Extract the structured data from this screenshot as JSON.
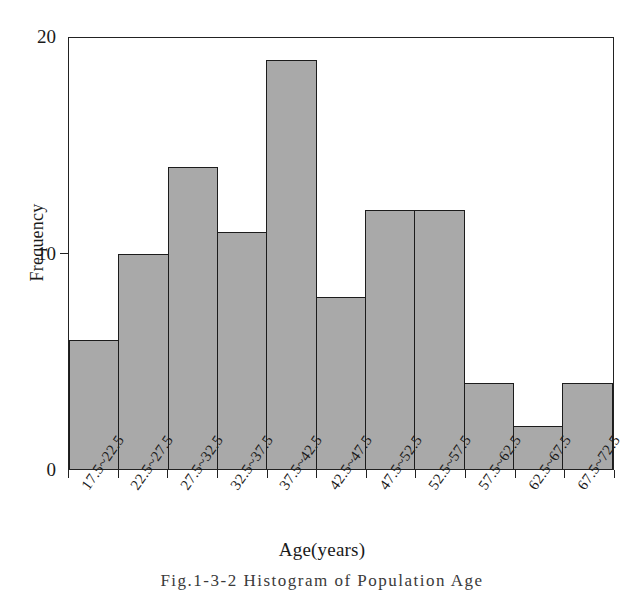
{
  "chart_data": {
    "type": "bar",
    "title": "",
    "xlabel": "Age(years)",
    "ylabel": "Frequency",
    "categories": [
      "17.5~22.5",
      "22.5~27.5",
      "27.5~32.5",
      "32.5~37.5",
      "37.5~42.5",
      "42.5~47.5",
      "47.5~52.5",
      "52.5~57.5",
      "57.5~62.5",
      "62.5~67.5",
      "67.5~72.5"
    ],
    "values": [
      6,
      10,
      14,
      11,
      19,
      8,
      12,
      12,
      4,
      2,
      4
    ],
    "ylim": [
      0,
      20
    ],
    "yticks": [
      0,
      10,
      20
    ],
    "ytick_labels": [
      "0",
      "10",
      "20"
    ],
    "grid": false,
    "legend": false,
    "bar_color": "#a9a9a9",
    "bar_edge_color": "#1c1c1c",
    "axis_color": "#222222"
  },
  "caption": {
    "text": "Fig.1-3-2  Histogram of Population Age"
  }
}
